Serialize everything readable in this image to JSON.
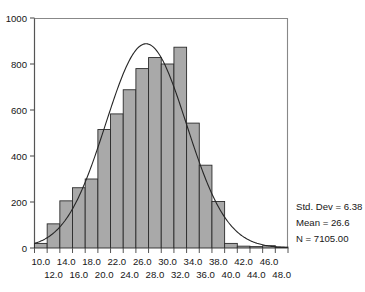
{
  "chart_data": {
    "type": "bar",
    "title": "",
    "subtitle": "",
    "xlabel": "",
    "ylabel": "",
    "grid": false,
    "legend_position": "none",
    "xlim": [
      9.0,
      49.0
    ],
    "ylim": [
      0,
      1000
    ],
    "bin_width": 2.0,
    "categories": [
      "10.0",
      "12.0",
      "14.0",
      "16.0",
      "18.0",
      "20.0",
      "22.0",
      "24.0",
      "26.0",
      "28.0",
      "30.0",
      "32.0",
      "34.0",
      "36.0",
      "38.0",
      "40.0",
      "42.0",
      "44.0",
      "46.0",
      "48.0"
    ],
    "bin_centers": [
      10,
      12,
      14,
      16,
      18,
      20,
      22,
      24,
      26,
      28,
      30,
      32,
      34,
      36,
      38,
      40,
      42,
      44,
      46,
      48
    ],
    "values": [
      20,
      105,
      205,
      262,
      300,
      515,
      583,
      688,
      780,
      828,
      800,
      873,
      543,
      360,
      202,
      20,
      8,
      6,
      10,
      4
    ],
    "yticks": [
      0,
      200,
      400,
      600,
      800,
      1000
    ],
    "ytick_labels": [
      "0",
      "200",
      "400",
      "600",
      "800",
      "1000"
    ],
    "xtick_labels_top": [
      "10.0",
      "14.0",
      "18.0",
      "22.0",
      "26.0",
      "30.0",
      "34.0",
      "38.0",
      "42.0",
      "46.0"
    ],
    "xtick_labels_bottom": [
      "12.0",
      "16.0",
      "20.0",
      "24.0",
      "28.0",
      "32.0",
      "36.0",
      "40.0",
      "44.0",
      "48.0"
    ],
    "overlay_curve": {
      "name": "normal-distribution-curve",
      "mean": 26.6,
      "std_dev": 6.38,
      "n": 7105,
      "peak_value": 888
    },
    "bar_fill_color": "#a9a9a9",
    "bar_edge_color": "#2b2b2b",
    "curve_color": "#262626",
    "axis_color": "#555555"
  },
  "annotations": {
    "std_dev": "Std. Dev = 6.38",
    "mean": "Mean = 26.6",
    "n": "N = 7105.00"
  }
}
